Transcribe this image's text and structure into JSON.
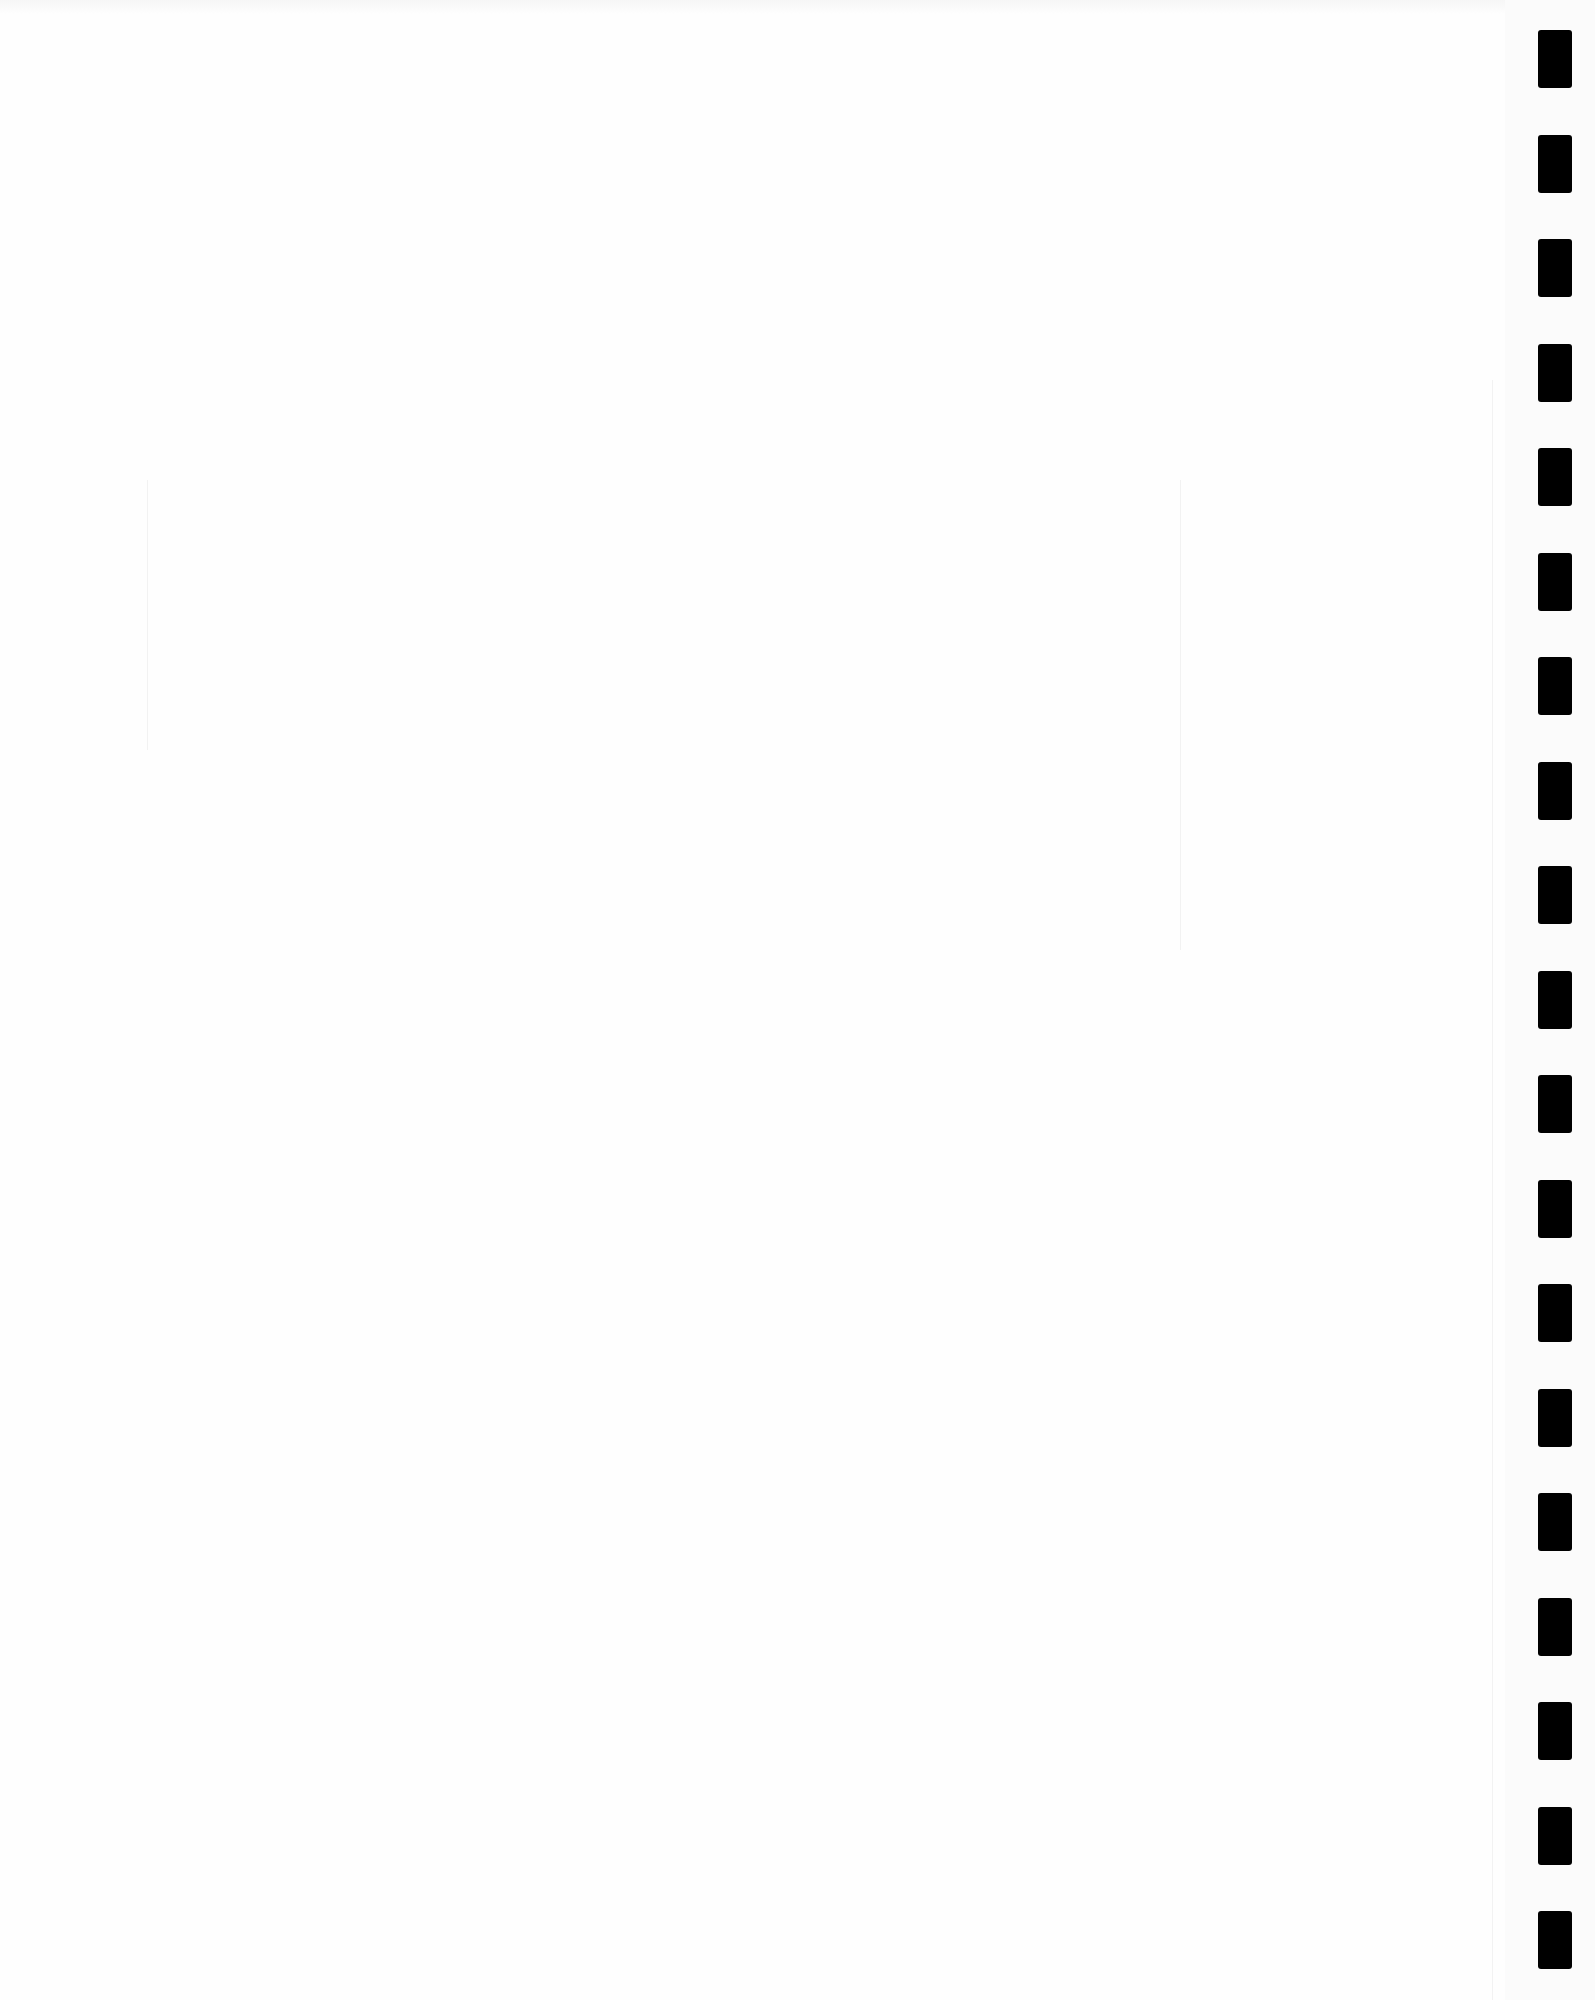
{
  "document": {
    "type": "blank scanned page",
    "text": ""
  },
  "binding": {
    "hole_count": 19,
    "hole_color": "#000000",
    "first_top": 30,
    "spacing": 104.5
  }
}
